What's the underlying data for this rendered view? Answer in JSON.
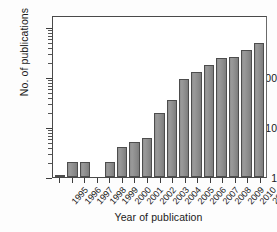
{
  "chart_data": {
    "type": "bar",
    "title": "",
    "xlabel": "Year of publication",
    "ylabel": "No. of publications",
    "yscale": "log",
    "ylim": [
      1,
      1000
    ],
    "ytick_labels": [
      "1",
      "10",
      "100"
    ],
    "ytick_values": [
      1,
      10,
      100
    ],
    "grid": false,
    "legend": null,
    "categories": [
      "1995",
      "1996",
      "1997",
      "1998",
      "1999",
      "2000",
      "2001",
      "2002",
      "2003",
      "2004",
      "2005",
      "2006",
      "2007",
      "2008",
      "2009",
      "2010",
      "2011"
    ],
    "values": [
      1,
      2,
      2,
      0,
      2,
      4,
      5,
      6,
      19,
      35,
      90,
      125,
      175,
      235,
      255,
      350,
      470
    ],
    "bar_color": "#8e8e8e",
    "bar_edge_color": "#4d4d4d",
    "axis_color": "#3d3d3d"
  }
}
